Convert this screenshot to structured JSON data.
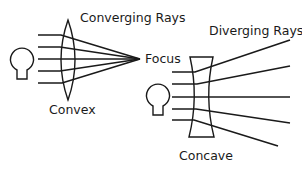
{
  "diagram": {
    "convex": {
      "title": "Converging Rays",
      "lens_label": "Convex",
      "focus_label": "Focus"
    },
    "concave": {
      "title": "Diverging Rays",
      "lens_label": "Concave"
    },
    "colors": {
      "stroke": "#1a1a1a",
      "background": "#ffffff"
    }
  }
}
